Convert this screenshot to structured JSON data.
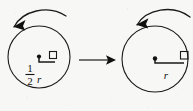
{
  "figure": {
    "background_color": "#f7f7f5",
    "ink_color": "#1a1a1a",
    "width": 193,
    "height": 111
  },
  "left_shape": {
    "name": "small-circle",
    "center": {
      "x": 39,
      "y": 57
    },
    "radius": 31,
    "radius_label_numerator": "1",
    "radius_label_denominator": "2",
    "radius_label_variable": "r",
    "radius_label_full": "1/2 r",
    "rotation_direction": "counterclockwise",
    "has_right_angle_marker": true
  },
  "right_shape": {
    "name": "large-circle",
    "center": {
      "x": 155,
      "y": 59
    },
    "radius": 33,
    "radius_label_variable": "r",
    "radius_label_full": "r",
    "rotation_direction": "counterclockwise",
    "has_right_angle_marker": true
  },
  "transform_arrow": {
    "name": "transformation-arrow",
    "direction": "right",
    "start_x": 79,
    "end_x": 115,
    "y": 60
  },
  "rotation_arrows": {
    "left_label": "counterclockwise rotation",
    "right_label": "counterclockwise rotation"
  }
}
